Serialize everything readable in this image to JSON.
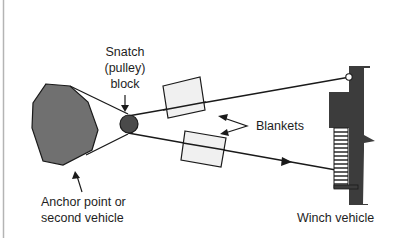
{
  "diagram": {
    "type": "winch-rigging-diagram",
    "labels": {
      "snatch_block_line1": "Snatch",
      "snatch_block_line2": "(pulley)",
      "snatch_block_line3": "block",
      "blankets": "Blankets",
      "anchor_line1": "Anchor point or",
      "anchor_line2": "second vehicle",
      "winch_vehicle": "Winch vehicle"
    },
    "colors": {
      "anchor_fill": "#707070",
      "pulley_fill": "#4a4a4a",
      "vehicle_fill": "#3c3c3c",
      "blanket_fill": "#f0f0f0",
      "line": "#1a1a1a",
      "frame_border": "#b4b4b4"
    },
    "icons": {
      "anchor": "octagon-shape",
      "pulley": "circle-shape",
      "blanket": "rectangle-shape",
      "winch_vehicle": "vehicle-side-profile",
      "arrow": "arrow-icon"
    }
  }
}
